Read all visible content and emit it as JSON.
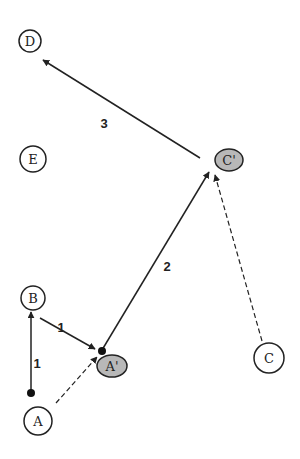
{
  "diagram": {
    "colors": {
      "stroke": "#222222",
      "node_fill": "#ffffff",
      "moved_node_fill": "#b8b8b8",
      "background": "#ffffff"
    },
    "nodes": [
      {
        "id": "D",
        "label": "D",
        "type": "circle",
        "cx": 30,
        "cy": 41,
        "r": 11
      },
      {
        "id": "E",
        "label": "E",
        "type": "circle",
        "cx": 33,
        "cy": 159,
        "r": 13
      },
      {
        "id": "B",
        "label": "B",
        "type": "circle",
        "cx": 33,
        "cy": 298,
        "r": 12
      },
      {
        "id": "A",
        "label": "A",
        "type": "circle",
        "cx": 38,
        "cy": 421,
        "r": 14
      },
      {
        "id": "C",
        "label": "C",
        "type": "circle",
        "cx": 269,
        "cy": 358,
        "r": 15
      },
      {
        "id": "A_prime",
        "label": "A'",
        "type": "ellipse",
        "cx": 112,
        "cy": 366,
        "rx": 15,
        "ry": 11
      },
      {
        "id": "C_prime",
        "label": "C'",
        "type": "ellipse",
        "cx": 229,
        "cy": 160,
        "rx": 14,
        "ry": 11
      }
    ],
    "edges": [
      {
        "from": "A",
        "to": "B",
        "style": "solid",
        "label": "1",
        "x1": 31,
        "y1": 393,
        "x2": 31,
        "y2": 312,
        "lx": 37,
        "ly": 365
      },
      {
        "from": "B",
        "to": "A_prime",
        "style": "solid",
        "label": "1",
        "x1": 40,
        "y1": 318,
        "x2": 95,
        "y2": 349,
        "lx": 61,
        "ly": 329
      },
      {
        "from": "A_prime",
        "to": "C_prime",
        "style": "solid",
        "label": "2",
        "x1": 102,
        "y1": 350,
        "x2": 209,
        "y2": 172,
        "lx": 167,
        "ly": 268
      },
      {
        "from": "C_prime",
        "to": "D",
        "style": "solid",
        "label": "3",
        "x1": 200,
        "y1": 158,
        "x2": 43,
        "y2": 60,
        "lx": 104,
        "ly": 125
      },
      {
        "from": "A",
        "to": "A_prime",
        "style": "dashed",
        "label": "",
        "x1": 56,
        "y1": 403,
        "x2": 97,
        "y2": 357
      },
      {
        "from": "C",
        "to": "C_prime",
        "style": "dashed",
        "label": "",
        "x1": 262,
        "y1": 341,
        "x2": 215,
        "y2": 175
      }
    ],
    "dots": [
      {
        "cx": 31,
        "cy": 393,
        "r": 4
      },
      {
        "cx": 102,
        "cy": 351,
        "r": 4
      }
    ]
  }
}
